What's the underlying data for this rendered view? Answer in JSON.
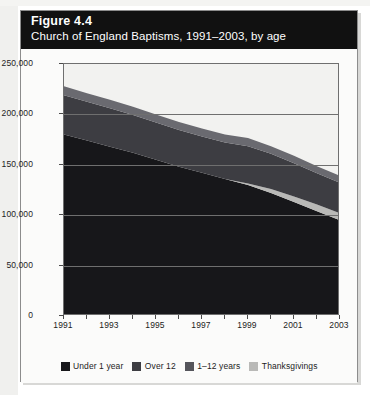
{
  "figure": {
    "number_label": "Figure 4.4",
    "subtitle": "Church of England Baptisms, 1991–2003, by age"
  },
  "colors": {
    "title_bar_bg": "#111111",
    "title_text": "#ffffff",
    "card_bg": "#fbfbfa",
    "plot_bg": "#f2f2f0",
    "axis": "#6f6f6f",
    "series_under1": "#17171a",
    "series_thanksgivings_band": "#b9b9b7",
    "series_1to12": "#3d3d42",
    "series_over12": "#6a6a70",
    "legend_thanksgivings": "#b9b9b7"
  },
  "axes": {
    "y_ticks": [
      "0",
      "50,000",
      "100,000",
      "150,000",
      "200,000",
      "250,000"
    ],
    "y_min": 0,
    "y_max": 250000,
    "y_step": 50000,
    "x_ticks_labeled": [
      "1991",
      "1993",
      "1995",
      "1997",
      "1999",
      "2001",
      "2003"
    ],
    "x_min": 1991,
    "x_max": 2003
  },
  "legend": {
    "items": [
      {
        "label": "Under 1 year",
        "color": "#17171a"
      },
      {
        "label": "Over 12",
        "color": "#3d3d42"
      },
      {
        "label": "1–12 years",
        "color": "#55555b"
      },
      {
        "label": "Thanksgivings",
        "color": "#b9b9b7"
      }
    ]
  },
  "chart_data": {
    "type": "area",
    "stacked": true,
    "title": "Church of England Baptisms, 1991–2003, by age",
    "xlabel": "",
    "ylabel": "",
    "ylim": [
      0,
      250000
    ],
    "xlim": [
      1991,
      2003
    ],
    "grid": true,
    "legend_position": "bottom",
    "x": [
      1991,
      1992,
      1993,
      1994,
      1995,
      1996,
      1997,
      1998,
      1999,
      2000,
      2001,
      2002,
      2003
    ],
    "series": [
      {
        "name": "Under 1 year",
        "color": "#17171a",
        "values": [
          180000,
          174000,
          168000,
          162000,
          155000,
          148000,
          142000,
          136000,
          130000,
          122000,
          113000,
          104000,
          95000
        ]
      },
      {
        "name": "Thanksgivings",
        "color": "#b9b9b7",
        "values": [
          0,
          0,
          0,
          0,
          0,
          0,
          0,
          0,
          1500,
          4000,
          5500,
          6500,
          7000
        ]
      },
      {
        "name": "1–12 years",
        "color": "#3d3d42",
        "values": [
          39000,
          38500,
          38000,
          37500,
          37000,
          36500,
          36000,
          36000,
          37000,
          35000,
          33000,
          31000,
          30000
        ]
      },
      {
        "name": "Over 12",
        "color": "#6a6a70",
        "values": [
          9000,
          8500,
          8500,
          8000,
          8000,
          8000,
          8000,
          8000,
          8000,
          7500,
          7500,
          7000,
          7000
        ]
      }
    ],
    "totals": [
      228000,
      221000,
      214500,
      207500,
      200000,
      192500,
      186000,
      180000,
      176500,
      168500,
      159000,
      148500,
      139000
    ]
  }
}
